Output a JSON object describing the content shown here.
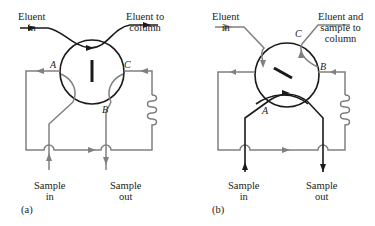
{
  "colors": {
    "black": "#1a1a1a",
    "gray": "#808080",
    "background": "#ffffff"
  },
  "panels": [
    {
      "id": "a",
      "caption": "(a)",
      "eluent_in": [
        "Eluent",
        "in"
      ],
      "eluent_out": [
        "Eluent to",
        "column"
      ],
      "port_labels": {
        "A": "A",
        "B": "B",
        "C": "C"
      },
      "sample_in": [
        "Sample",
        "in"
      ],
      "sample_out": [
        "Sample",
        "out"
      ],
      "rotor": "vertical",
      "icons": [
        "loop-coil-icon",
        "flow-arrow-icon"
      ]
    },
    {
      "id": "b",
      "caption": "(b)",
      "eluent_in": [
        "Eluent",
        "in"
      ],
      "eluent_out": [
        "Eluent and",
        "sample to",
        "column"
      ],
      "port_labels": {
        "A": "A",
        "B": "B",
        "C": "C"
      },
      "sample_in": [
        "Sample",
        "in"
      ],
      "sample_out": [
        "Sample",
        "out"
      ],
      "rotor": "diagonal",
      "icons": [
        "loop-coil-icon",
        "flow-arrow-icon"
      ]
    }
  ]
}
